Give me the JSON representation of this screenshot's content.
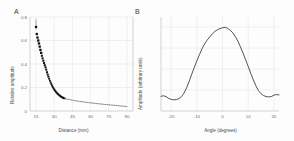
{
  "figure": {
    "background": "#fdfdfd",
    "line_color": "#404040",
    "marker_color": "#111111",
    "grid_color": "#e3e3e3",
    "axis_color": "#b9b9b9"
  },
  "panels": [
    {
      "letter": "A",
      "chart_data": {
        "type": "scatter",
        "title": "",
        "xlabel": "Distance (mm)",
        "ylabel": "Relative amplitude",
        "xlim": [
          10,
          95
        ],
        "ylim": [
          0,
          0.8
        ],
        "xticks": [
          15,
          30,
          45,
          60,
          75,
          90
        ],
        "yticks": [
          0,
          0.2,
          0.4,
          0.6,
          0.8
        ],
        "grid": true,
        "legend": "none",
        "series": [
          {
            "name": "measured",
            "style": "filled-square-markers",
            "x": [
              15.0,
              15.6,
              16.2,
              16.8,
              17.4,
              18.0,
              18.6,
              19.2,
              19.8,
              20.4,
              21.0,
              21.6,
              22.2,
              22.8,
              23.4,
              24.0,
              24.6,
              25.2,
              25.8,
              26.4,
              27.0,
              27.6,
              28.2,
              28.8,
              29.4,
              30.0,
              30.6,
              31.2,
              31.8,
              32.4,
              33.0,
              33.6,
              34.2,
              34.8,
              35.4,
              36.0,
              36.6,
              37.2,
              37.8,
              38.4
            ],
            "y": [
              0.715,
              0.655,
              0.625,
              0.6,
              0.575,
              0.548,
              0.52,
              0.495,
              0.47,
              0.448,
              0.428,
              0.408,
              0.39,
              0.372,
              0.352,
              0.33,
              0.31,
              0.292,
              0.274,
              0.258,
              0.243,
              0.229,
              0.216,
              0.204,
              0.193,
              0.183,
              0.174,
              0.166,
              0.158,
              0.151,
              0.145,
              0.139,
              0.134,
              0.129,
              0.124,
              0.12,
              0.116,
              0.113,
              0.11,
              0.107
            ]
          },
          {
            "name": "extrapolated-fit",
            "style": "dotted-line",
            "x": [
              38.4,
              42,
              46,
              50,
              54,
              58,
              62,
              66,
              70,
              74,
              78,
              82,
              86,
              90
            ],
            "y": [
              0.107,
              0.098,
              0.09,
              0.083,
              0.077,
              0.072,
              0.067,
              0.062,
              0.058,
              0.054,
              0.05,
              0.046,
              0.042,
              0.038
            ]
          }
        ]
      }
    },
    {
      "letter": "B",
      "chart_data": {
        "type": "line",
        "title": "",
        "xlabel": "Angle (degrees)",
        "ylabel": "Amplitude (arbitrary units)",
        "xlim": [
          -24,
          22
        ],
        "ylim": [
          0,
          1.12
        ],
        "xticks": [
          -20,
          -10,
          0,
          10,
          20
        ],
        "yticks": [],
        "grid": true,
        "legend": "none",
        "series": [
          {
            "name": "angular-response",
            "style": "solid-line",
            "x": [
              -24,
              -23,
              -22,
              -21,
              -20,
              -19,
              -18,
              -17,
              -16,
              -15,
              -14,
              -13,
              -12,
              -11,
              -10,
              -9,
              -8,
              -7,
              -6,
              -5,
              -4,
              -3,
              -2,
              -1,
              0,
              1,
              2,
              3,
              4,
              5,
              6,
              7,
              8,
              9,
              10,
              11,
              12,
              13,
              14,
              15,
              16,
              17,
              18,
              19,
              20,
              21,
              22
            ],
            "y": [
              0.175,
              0.182,
              0.17,
              0.15,
              0.138,
              0.133,
              0.136,
              0.148,
              0.172,
              0.215,
              0.278,
              0.355,
              0.44,
              0.52,
              0.6,
              0.672,
              0.742,
              0.8,
              0.845,
              0.882,
              0.918,
              0.948,
              0.968,
              0.982,
              0.992,
              0.998,
              0.985,
              0.962,
              0.93,
              0.885,
              0.83,
              0.762,
              0.688,
              0.61,
              0.53,
              0.448,
              0.37,
              0.3,
              0.243,
              0.205,
              0.183,
              0.172,
              0.168,
              0.172,
              0.188,
              0.196,
              0.192
            ]
          }
        ]
      }
    }
  ]
}
